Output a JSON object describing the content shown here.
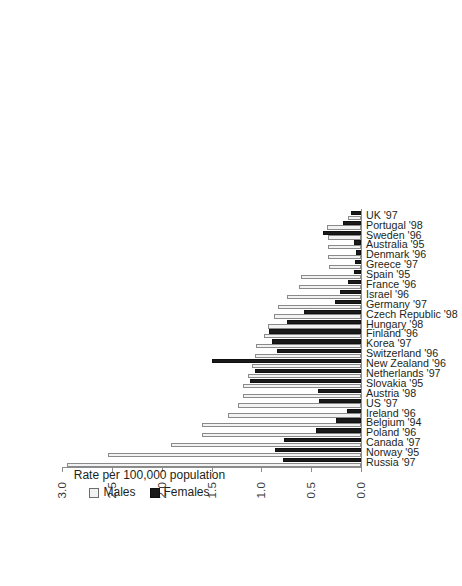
{
  "chart_data": {
    "type": "bar",
    "title": "",
    "xlabel": "",
    "ylabel": "Rate per 100,000 population",
    "ylim": [
      0.0,
      3.0
    ],
    "yticks": [
      "0.0",
      "0.5",
      "1.0",
      "1.5",
      "2.0",
      "2.5",
      "3.0"
    ],
    "ytick_values": [
      0.0,
      0.5,
      1.0,
      1.5,
      2.0,
      2.5,
      3.0
    ],
    "grid": false,
    "legend_position": "below-axis",
    "orientation": "vertical-bars-rotated",
    "categories": [
      "Russia '97",
      "Norway '95",
      "Canada '97",
      "Poland '96",
      "Belgium '94",
      "Ireland '96",
      "US '97",
      "Austria '98",
      "Slovakia '95",
      "Netherlands '97",
      "New Zealand '96",
      "Switzerland '96",
      "Korea '97",
      "Finland '96",
      "Hungary '98",
      "Czech Republic '98",
      "Germany '97",
      "Israel '96",
      "France '96",
      "Spain '95",
      "Greece '97",
      "Denmark '96",
      "Australia '95",
      "Sweden '96",
      "Portugal '98",
      "UK '97"
    ],
    "series": [
      {
        "name": "Males",
        "color": "#f2f2f2",
        "values": [
          2.95,
          2.54,
          1.91,
          1.6,
          1.6,
          1.33,
          1.23,
          1.18,
          1.18,
          1.13,
          1.09,
          1.06,
          1.05,
          0.97,
          0.93,
          0.87,
          0.83,
          0.74,
          0.62,
          0.6,
          0.32,
          0.33,
          0.33,
          0.33,
          0.34,
          0.13
        ]
      },
      {
        "name": "Females",
        "color": "#1a1a1a",
        "values": [
          0.78,
          0.86,
          0.77,
          0.45,
          0.25,
          0.14,
          0.42,
          0.43,
          1.11,
          1.06,
          1.5,
          0.84,
          0.89,
          0.92,
          0.74,
          0.57,
          0.26,
          0.21,
          0.13,
          0.07,
          0.06,
          0.05,
          0.07,
          0.38,
          0.18,
          0.1
        ]
      }
    ]
  },
  "legend": {
    "males_label": "Males",
    "females_label": "Females"
  },
  "axis": {
    "value_axis_title": "Rate per 100,000 population"
  }
}
